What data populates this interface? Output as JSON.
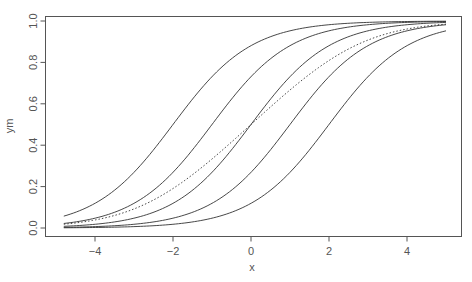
{
  "chart_data": {
    "type": "line",
    "title": "",
    "xlabel": "x",
    "ylabel": "ym",
    "xlim": [
      -5.25,
      5.4
    ],
    "ylim": [
      -0.04,
      1.04
    ],
    "x_ticks": [
      -4,
      -2,
      0,
      2,
      4
    ],
    "x_tick_labels": [
      "−4",
      "−2",
      "0",
      "2",
      "4"
    ],
    "y_ticks": [
      0.0,
      0.2,
      0.4,
      0.6,
      0.8,
      1.0
    ],
    "y_tick_labels": [
      "0.0",
      "0.2",
      "0.4",
      "0.6",
      "0.8",
      "1.0"
    ],
    "grid": false,
    "legend": null,
    "x_range": [
      -4.8,
      5.0
    ],
    "series": [
      {
        "name": "logistic center -2",
        "style": "solid",
        "center": -2,
        "slope": 1
      },
      {
        "name": "logistic center -1",
        "style": "solid",
        "center": -1,
        "slope": 1
      },
      {
        "name": "logistic center 0",
        "style": "solid",
        "center": 0,
        "slope": 1
      },
      {
        "name": "logistic center 1",
        "style": "solid",
        "center": 1,
        "slope": 1
      },
      {
        "name": "logistic center 2",
        "style": "solid",
        "center": 2,
        "slope": 1
      },
      {
        "name": "mean of curves",
        "style": "dotted",
        "mean_of": [
          -2,
          -1,
          0,
          1,
          2
        ]
      }
    ],
    "sample_values": {
      "x": [
        -4.8,
        -4,
        -2,
        0,
        2,
        4,
        5
      ],
      "center_-2": [
        0.057,
        0.119,
        0.5,
        0.881,
        0.982,
        0.998,
        0.999
      ],
      "center_-1": [
        0.022,
        0.047,
        0.269,
        0.731,
        0.953,
        0.993,
        0.998
      ],
      "center_0": [
        0.008,
        0.018,
        0.119,
        0.5,
        0.881,
        0.982,
        0.993
      ],
      "center_1": [
        0.003,
        0.007,
        0.047,
        0.269,
        0.731,
        0.953,
        0.982
      ],
      "center_2": [
        0.001,
        0.002,
        0.018,
        0.119,
        0.5,
        0.881,
        0.953
      ],
      "mean": [
        0.018,
        0.039,
        0.191,
        0.5,
        0.809,
        0.961,
        0.985
      ]
    }
  },
  "plot_area": {
    "left": 45,
    "top": 16,
    "right": 461,
    "bottom": 236
  },
  "colors": {
    "line": "#333333",
    "axis": "#555555",
    "background": "#ffffff"
  }
}
